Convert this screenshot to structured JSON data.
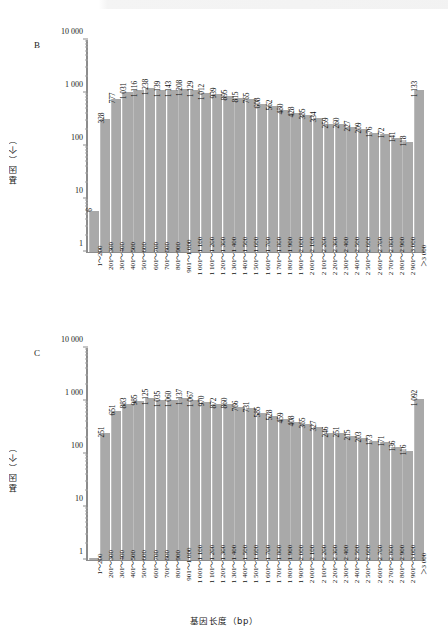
{
  "figure": {
    "axis_y_title": "基因（个）",
    "axis_x_title": "基因长度（bp）",
    "bar_color": "#a9a9a9",
    "axis_color": "#8c8c8c",
    "y_ticks": [
      "1",
      "10",
      "100",
      "1 000",
      "10 000"
    ]
  },
  "categories": [
    "1～200",
    "201～300",
    "301～400",
    "401～500",
    "501～600",
    "601～700",
    "701～800",
    "801～900",
    "901～1 000",
    "1 001～1 100",
    "1 101～1 200",
    "1 201～1 300",
    "1 301～1 400",
    "1 401～1 500",
    "1 501～1 600",
    "1 601～1 700",
    "1 701～1 800",
    "1 801～1 900",
    "1 901～2 000",
    "2 001～2 100",
    "2 101～2 200",
    "2 201～2 300",
    "2 301～2 400",
    "2 401～2 500",
    "2 501～2 600",
    "2 601～2 700",
    "2 701～2 800",
    "2 801～2 900",
    "2 901～3 000",
    "＞3 000"
  ],
  "chart_data": [
    {
      "type": "bar",
      "panel": "B",
      "title": "",
      "xlabel": "基因长度（bp）",
      "ylabel": "基因（个）",
      "yscale": "log",
      "ylim": [
        1,
        10000
      ],
      "grid": false,
      "legend": "none",
      "categories": [
        "1～200",
        "201～300",
        "301～400",
        "401～500",
        "501～600",
        "601～700",
        "701～800",
        "801～900",
        "901～1 000",
        "1 001～1 100",
        "1 101～1 200",
        "1 201～1 300",
        "1 301～1 400",
        "1 401～1 500",
        "1 501～1 600",
        "1 601～1 700",
        "1 701～1 800",
        "1 801～1 900",
        "1 901～2 000",
        "2 001～2 100",
        "2 101～2 200",
        "2 201～2 300",
        "2 301～2 400",
        "2 401～2 500",
        "2 501～2 600",
        "2 601～2 700",
        "2 701～2 800",
        "2 801～2 900",
        "2 901～3 000",
        "＞3 000"
      ],
      "values": [
        6,
        328,
        777,
        1031,
        1116,
        1238,
        1139,
        1143,
        1208,
        1129,
        1012,
        939,
        895,
        815,
        765,
        608,
        562,
        480,
        428,
        385,
        334,
        259,
        260,
        227,
        209,
        176,
        172,
        141,
        118,
        1133
      ],
      "labels": [
        "6",
        "328",
        "777",
        "1 031",
        "1 116",
        "1 238",
        "1 139",
        "1 143",
        "1 208",
        "1 129",
        "1 012",
        "939",
        "895",
        "815",
        "765",
        "608",
        "562",
        "480",
        "428",
        "385",
        "334",
        "259",
        "260",
        "227",
        "209",
        "176",
        "172",
        "141",
        "118",
        "1 133"
      ]
    },
    {
      "type": "bar",
      "panel": "C",
      "title": "",
      "xlabel": "基因长度（bp）",
      "ylabel": "基因（个）",
      "yscale": "log",
      "ylim": [
        1,
        10000
      ],
      "grid": false,
      "legend": "none",
      "categories": [
        "1～200",
        "201～300",
        "301～400",
        "401～500",
        "501～600",
        "601～700",
        "701～800",
        "801～900",
        "901～1 000",
        "1 001～1 100",
        "1 101～1 200",
        "1 201～1 300",
        "1 301～1 400",
        "1 401～1 500",
        "1 501～1 600",
        "1 601～1 700",
        "1 701～1 800",
        "1 801～1 900",
        "1 901～2 000",
        "2 001～2 100",
        "2 101～2 200",
        "2 201～2 300",
        "2 301～2 400",
        "2 401～2 500",
        "2 501～2 600",
        "2 601～2 700",
        "2 701～2 800",
        "2 801～2 900",
        "2 901～3 000",
        "＞3 000"
      ],
      "values": [
        1,
        251,
        651,
        883,
        985,
        1125,
        1035,
        1060,
        1137,
        1067,
        970,
        872,
        860,
        766,
        731,
        585,
        528,
        459,
        408,
        365,
        327,
        246,
        251,
        215,
        203,
        173,
        171,
        136,
        116,
        1092
      ],
      "labels": [
        "",
        "251",
        "651",
        "883",
        "985",
        "1 125",
        "1 035",
        "1 060",
        "1 137",
        "1 067",
        "970",
        "872",
        "860",
        "766",
        "731",
        "585",
        "528",
        "459",
        "408",
        "365",
        "327",
        "246",
        "251",
        "215",
        "203",
        "173",
        "171",
        "136",
        "116",
        "1 092"
      ]
    }
  ]
}
